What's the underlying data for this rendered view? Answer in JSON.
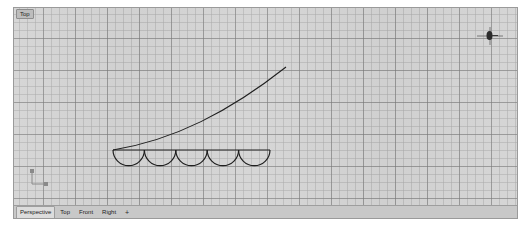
{
  "app": {
    "name": "Rhino 3D Viewport",
    "background_color": "#ffffff"
  },
  "viewport": {
    "title": "Top",
    "grid": {
      "background_color": "#d4d4d4",
      "minor_line_color": "#aaaaaa",
      "major_line_color": "#787878",
      "minor_spacing_px": 8,
      "major_spacing_px": 32
    },
    "geometry_color": "#1a1a1a",
    "objects": [
      {
        "name": "rising-curve",
        "type": "curve"
      },
      {
        "name": "horizontal-baseline",
        "type": "line"
      },
      {
        "name": "scallop-arcs",
        "type": "arc-series",
        "count": 5
      }
    ],
    "gizmo": {
      "name": "navigation-gizmo"
    },
    "axis_icon": {
      "x_label": "x",
      "y_label": "y"
    }
  },
  "tabs": {
    "items": [
      {
        "label": "Perspective",
        "active": true
      },
      {
        "label": "Top",
        "active": false
      },
      {
        "label": "Front",
        "active": false
      },
      {
        "label": "Right",
        "active": false
      }
    ],
    "add_label": "+"
  }
}
